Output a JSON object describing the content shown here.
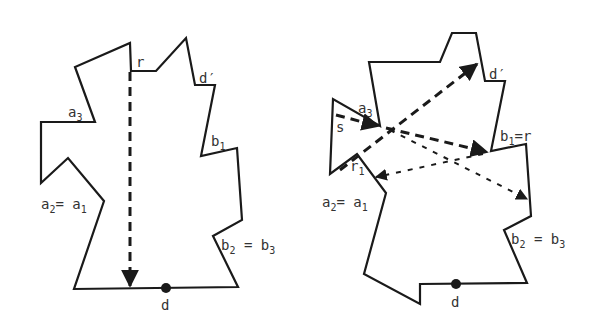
{
  "left_figure": {
    "labels": {
      "r": "r",
      "d_prime": "d′",
      "a3": "a",
      "a3_sub": "3",
      "b1": "b",
      "b1_sub": "1",
      "a2a1_a": "a",
      "a2a1_sub2": "2",
      "a2a1_eq": "= a",
      "a2a1_sub1": "1",
      "b2b3_b": "b",
      "b2b3_sub2": "2",
      "b2b3_eq": " = b",
      "b2b3_sub3": "3",
      "d": "d"
    }
  },
  "right_figure": {
    "labels": {
      "d_prime": "d′",
      "a3": "a",
      "a3_sub": "3",
      "s": "s",
      "b1r": "b",
      "b1r_sub": "1",
      "b1r_eq": "=r",
      "r1": "r",
      "r1_sub": "1",
      "a2a1_a": "a",
      "a2a1_sub2": "2",
      "a2a1_eq": "= a",
      "a2a1_sub1": "1",
      "b2b3_b": "b",
      "b2b3_sub2": "2",
      "b2b3_eq": " = b",
      "b2b3_sub3": "3",
      "d": "d"
    }
  },
  "colors": {
    "stroke": "#1a1a1a",
    "label": "#333333",
    "background": "#ffffff"
  }
}
